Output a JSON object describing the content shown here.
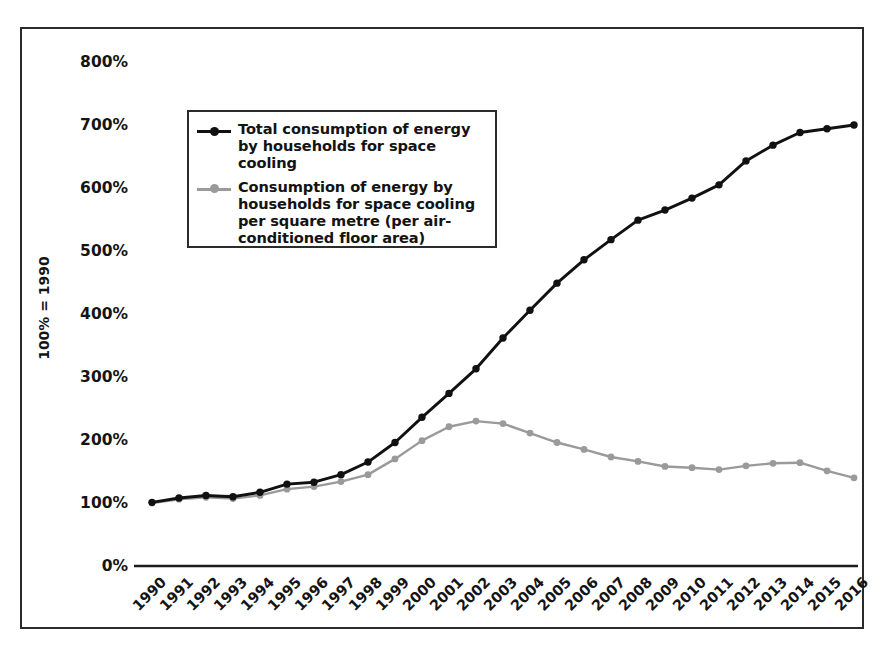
{
  "chart_data": {
    "type": "line",
    "title": "",
    "xlabel": "",
    "ylabel": "100% = 1990",
    "ylim": [
      0,
      800
    ],
    "ytick_labels": [
      "800%",
      "700%",
      "600%",
      "500%",
      "400%",
      "300%",
      "200%",
      "100%",
      "0%"
    ],
    "ytick_values": [
      800,
      700,
      600,
      500,
      400,
      300,
      200,
      100,
      0
    ],
    "grid": false,
    "legend_position": "upper-left-inside",
    "x": [
      1990,
      1991,
      1992,
      1993,
      1994,
      1995,
      1996,
      1997,
      1998,
      1999,
      2000,
      2001,
      2002,
      2003,
      2004,
      2005,
      2006,
      2007,
      2008,
      2009,
      2010,
      2011,
      2012,
      2013,
      2014,
      2015,
      2016
    ],
    "categories": [
      "1990",
      "1991",
      "1992",
      "1993",
      "1994",
      "1995",
      "1996",
      "1997",
      "1998",
      "1999",
      "2000",
      "2001",
      "2002",
      "2003",
      "2004",
      "2005",
      "2006",
      "2007",
      "2008",
      "2009",
      "2010",
      "2011",
      "2012",
      "2013",
      "2014",
      "2015",
      "2016"
    ],
    "series": [
      {
        "name": "Total consumption of energy by households for space cooling",
        "color": "#111111",
        "values": [
          101,
          108,
          112,
          110,
          117,
          130,
          133,
          145,
          165,
          196,
          236,
          274,
          313,
          362,
          406,
          449,
          486,
          518,
          549,
          565,
          584,
          605,
          643,
          668,
          688,
          694,
          700
        ]
      },
      {
        "name": "Consumption of energy by households for space cooling per square metre (per air-conditioned floor area)",
        "color": "#9a9a9a",
        "values": [
          100,
          106,
          109,
          107,
          112,
          122,
          126,
          134,
          145,
          170,
          199,
          221,
          230,
          226,
          211,
          196,
          185,
          173,
          166,
          158,
          156,
          153,
          159,
          163,
          164,
          151,
          140
        ]
      }
    ]
  },
  "legend": {
    "entries": [
      {
        "label": "Total consumption of energy by households for space cooling",
        "color": "#111111",
        "marker": "circle-marker"
      },
      {
        "label": "Consumption of energy by households for space cooling per square metre (per air-conditioned floor area)",
        "color": "#9a9a9a",
        "marker": "circle-marker"
      }
    ]
  },
  "axes": {
    "y_title": "100% = 1990"
  }
}
